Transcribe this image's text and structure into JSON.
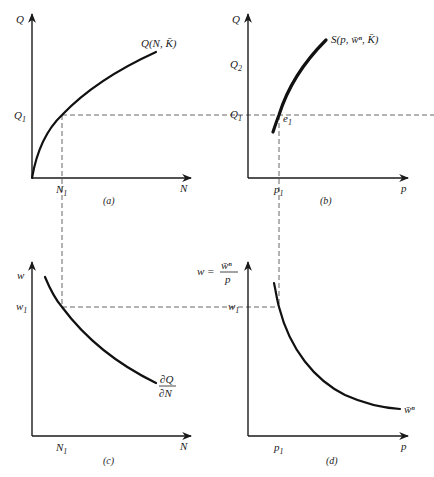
{
  "figure": {
    "panels": [
      {
        "id": "a",
        "caption": "(a)",
        "y_axis_label": "Q",
        "x_axis_label": "N",
        "y_tick": {
          "main": "Q",
          "sub": "1"
        },
        "x_tick": {
          "main": "N",
          "sub": "1"
        },
        "curve_label": "Q(N, K̄)",
        "curve_shape": "concave increasing from origin"
      },
      {
        "id": "b",
        "caption": "(b)",
        "y_axis_label": "Q",
        "x_axis_label": "p",
        "y_ticks": [
          {
            "main": "Q",
            "sub": "2"
          },
          {
            "main": "Q",
            "sub": "1"
          }
        ],
        "x_tick": {
          "main": "p",
          "sub": "1"
        },
        "point_label": {
          "main": "e",
          "sub": "1"
        },
        "curve_label": "S(p, w̄ⁿ, K̄)",
        "curve_shape": "increasing concave supply curve"
      },
      {
        "id": "c",
        "caption": "(c)",
        "y_axis_label": "w",
        "x_axis_label": "N",
        "y_tick": {
          "main": "w",
          "sub": "1"
        },
        "x_tick": {
          "main": "N",
          "sub": "1"
        },
        "curve_label": {
          "numerator": "∂Q",
          "denominator": "∂N"
        },
        "curve_shape": "decreasing convex"
      },
      {
        "id": "d",
        "caption": "(d)",
        "y_axis_label": {
          "lhs": "w =",
          "numerator": "w̄ⁿ",
          "denominator": "p"
        },
        "x_axis_label": "p",
        "y_tick": {
          "main": "w",
          "sub": "1"
        },
        "x_tick": {
          "main": "p",
          "sub": "1"
        },
        "curve_label": "w̄ⁿ",
        "curve_shape": "rectangular hyperbola"
      }
    ],
    "guides": [
      {
        "name": "Q1-horizontal",
        "from_panel": "a",
        "to_panel": "b"
      },
      {
        "name": "N1-vertical",
        "from_panel": "a",
        "to_panel": "c"
      },
      {
        "name": "p1-vertical",
        "from_panel": "b",
        "to_panel": "d"
      },
      {
        "name": "w1-horizontal",
        "from_panel": "c",
        "to_panel": "d"
      }
    ]
  }
}
